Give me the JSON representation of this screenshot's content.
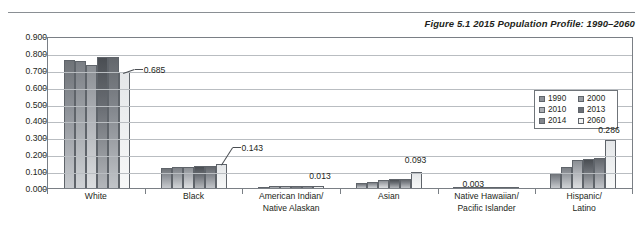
{
  "figure": {
    "label": "Figure 5.1",
    "title": "2015 Population Profile: 1990–2060",
    "full_title": "Figure 5.1   2015 Population Profile: 1990–2060"
  },
  "legend": {
    "position": "top-right-inside",
    "entries": [
      {
        "label": "1990",
        "swatch": "#8e9298"
      },
      {
        "label": "2000",
        "swatch": "#9a9ea3"
      },
      {
        "label": "2010",
        "swatch": "#abaeb3"
      },
      {
        "label": "2013",
        "swatch": "#6a6e74"
      },
      {
        "label": "2014",
        "swatch": "#82868c"
      },
      {
        "label": "2060",
        "swatch": "#f2f3f3"
      }
    ]
  },
  "axis": {
    "y_ticks": [
      "0.900",
      "0.800",
      "0.700",
      "0.600",
      "0.500",
      "0.400",
      "0.300",
      "0.200",
      "0.100",
      "0.000"
    ]
  },
  "callouts": [
    {
      "value": "0.685",
      "group": "White",
      "series": "2060"
    },
    {
      "value": "0.143",
      "group": "Black",
      "series": "2060"
    },
    {
      "value": "0.013",
      "group": "American Indian/Native Alaskan",
      "series": "2060"
    },
    {
      "value": "0.093",
      "group": "Asian",
      "series": "2060"
    },
    {
      "value": "0.003",
      "group": "Native Hawaiian/Pacific Islander",
      "series": "2060"
    },
    {
      "value": "0.286",
      "group": "Hispanic/Latino",
      "series": "2060"
    }
  ],
  "categories_display": [
    {
      "line1": "White",
      "line2": ""
    },
    {
      "line1": "Black",
      "line2": ""
    },
    {
      "line1": "American Indian/",
      "line2": "Native Alaskan"
    },
    {
      "line1": "Asian",
      "line2": ""
    },
    {
      "line1": "Native Hawaiian/",
      "line2": "Pacific Islander"
    },
    {
      "line1": "Hispanic/",
      "line2": "Latino"
    }
  ],
  "chart_data": {
    "type": "bar",
    "title": "Figure 5.1 2015 Population Profile: 1990–2060",
    "xlabel": "",
    "ylabel": "",
    "ylim": [
      0.0,
      0.9
    ],
    "ytick_step": 0.1,
    "grid": true,
    "legend_position": "top-right",
    "categories": [
      "White",
      "Black",
      "American Indian/Native Alaskan",
      "Asian",
      "Native Hawaiian/Pacific Islander",
      "Hispanic/Latino"
    ],
    "series": [
      {
        "name": "1990",
        "values": [
          0.757,
          0.121,
          0.008,
          0.028,
          0.002,
          0.09
        ]
      },
      {
        "name": "2000",
        "values": [
          0.751,
          0.123,
          0.009,
          0.038,
          0.002,
          0.125
        ]
      },
      {
        "name": "2010",
        "values": [
          0.728,
          0.126,
          0.009,
          0.048,
          0.002,
          0.163
        ]
      },
      {
        "name": "2013",
        "values": [
          0.776,
          0.132,
          0.012,
          0.053,
          0.002,
          0.17
        ]
      },
      {
        "name": "2014",
        "values": [
          0.774,
          0.132,
          0.012,
          0.054,
          0.002,
          0.175
        ]
      },
      {
        "name": "2060",
        "values": [
          0.685,
          0.143,
          0.013,
          0.093,
          0.003,
          0.286
        ]
      }
    ],
    "data_labels": [
      {
        "category": "White",
        "series": "2060",
        "value": 0.685
      },
      {
        "category": "Black",
        "series": "2060",
        "value": 0.143
      },
      {
        "category": "American Indian/Native Alaskan",
        "series": "2060",
        "value": 0.013
      },
      {
        "category": "Asian",
        "series": "2060",
        "value": 0.093
      },
      {
        "category": "Native Hawaiian/Pacific Islander",
        "series": "2060",
        "value": 0.003
      },
      {
        "category": "Hispanic/Latino",
        "series": "2060",
        "value": 0.286
      }
    ]
  }
}
